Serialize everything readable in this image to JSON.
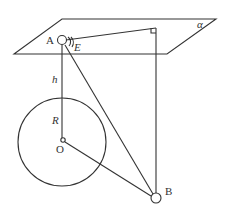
{
  "diagram": {
    "type": "geometry-figure",
    "labels": {
      "plane": "α",
      "point_a": "A",
      "point_e": "E",
      "height": "h",
      "radius": "R",
      "center": "O",
      "point_b": "B"
    },
    "elements": [
      "plane α",
      "point A on plane",
      "angle E at A",
      "right angle marker",
      "vertical segment h from A",
      "sphere/circle with center O and radius R",
      "segment AB",
      "segment OB",
      "vertical line from plane to B"
    ]
  }
}
